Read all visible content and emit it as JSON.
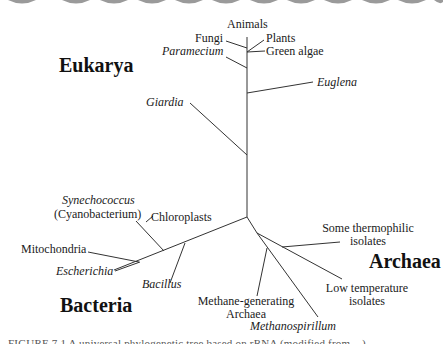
{
  "diagram": {
    "type": "unrooted phylogenetic tree",
    "domains": {
      "eukarya": "Eukarya",
      "bacteria": "Bacteria",
      "archaea": "Archaea"
    },
    "eukarya_taxa": {
      "animals": "Animals",
      "fungi": "Fungi",
      "plants": "Plants",
      "green_algae": "Green algae",
      "paramecium": "Paramecium",
      "euglena": "Euglena",
      "giardia": "Giardia"
    },
    "bacteria_taxa": {
      "synechococcus": "Synechococcus",
      "cyanobacterium": "(Cyanobacterium)",
      "chloroplasts": "Chloroplasts",
      "mitochondria": "Mitochondria",
      "escherichia": "Escherichia",
      "bacillus": "Bacillus"
    },
    "archaea_taxa": {
      "thermophilic_1": "Some thermophilic",
      "thermophilic_2": "isolates",
      "lowtemp_1": "Low temperature",
      "lowtemp_2": "isolates",
      "methanogen_1": "Methane-generating",
      "methanogen_2": "Archaea",
      "methanospirillum": "Methanospirillum"
    },
    "caption": "FIGURE 7.1 A universal phylogenetic tree based on rRNA (modified from ...)"
  }
}
